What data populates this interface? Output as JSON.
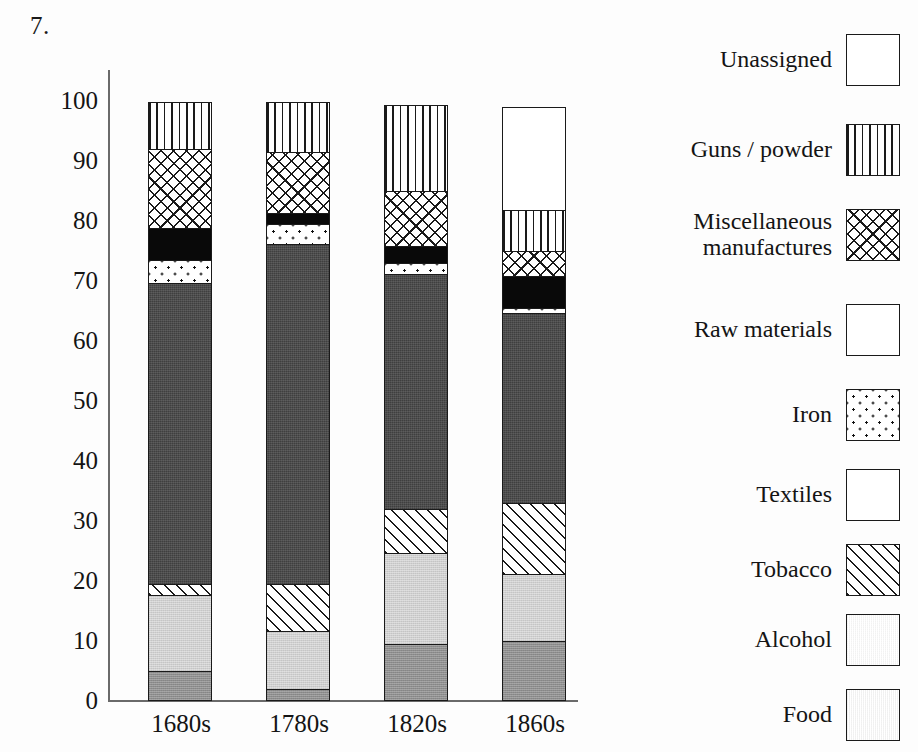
{
  "figure": {
    "number": "7."
  },
  "axes": {
    "y_ticks": [
      "100",
      "90",
      "80",
      "70",
      "60",
      "50",
      "40",
      "30",
      "20",
      "10",
      "0"
    ],
    "x_ticks": [
      "1680s",
      "1780s",
      "1820s",
      "1860s"
    ]
  },
  "legend": {
    "items": [
      {
        "label": "Unassigned",
        "pattern": "pat-unassigned",
        "name": "unassigned"
      },
      {
        "label": "Guns / powder",
        "pattern": "pat-guns",
        "name": "guns-powder"
      },
      {
        "label": "Miscellaneous\nmanufactures",
        "pattern": "pat-misc",
        "name": "miscellaneous-manufactures"
      },
      {
        "label": "Raw materials",
        "pattern": "pat-raw",
        "name": "raw-materials"
      },
      {
        "label": "Iron",
        "pattern": "pat-iron",
        "name": "iron"
      },
      {
        "label": "Textiles",
        "pattern": "pat-textiles",
        "name": "textiles"
      },
      {
        "label": "Tobacco",
        "pattern": "pat-tobacco",
        "name": "tobacco"
      },
      {
        "label": "Alcohol",
        "pattern": "pat-alcohol",
        "name": "alcohol"
      },
      {
        "label": "Food",
        "pattern": "pat-food",
        "name": "food"
      }
    ]
  },
  "chart_data": {
    "type": "bar",
    "subtype": "stacked-bar",
    "title": "",
    "xlabel": "",
    "ylabel": "",
    "ylim": [
      0,
      105
    ],
    "y_tick_values": [
      0,
      10,
      20,
      30,
      40,
      50,
      60,
      70,
      80,
      90,
      100
    ],
    "grid": false,
    "legend_position": "right",
    "categories": [
      "1680s",
      "1780s",
      "1820s",
      "1860s"
    ],
    "stack_order_bottom_to_top": [
      "Food",
      "Alcohol",
      "Tobacco",
      "Textiles",
      "Iron",
      "Raw materials",
      "Miscellaneous manufactures",
      "Guns / powder",
      "Unassigned"
    ],
    "series": [
      {
        "name": "Food",
        "pattern": "pat-food",
        "values": [
          5.0,
          2.0,
          9.5,
          10.0
        ]
      },
      {
        "name": "Alcohol",
        "pattern": "pat-alcohol",
        "values": [
          13.0,
          10.0,
          15.5,
          11.5
        ]
      },
      {
        "name": "Tobacco",
        "pattern": "pat-tobacco",
        "values": [
          2.0,
          8.0,
          7.5,
          12.0
        ]
      },
      {
        "name": "Textiles",
        "pattern": "pat-textiles",
        "values": [
          50.5,
          57.0,
          39.5,
          32.0
        ]
      },
      {
        "name": "Iron",
        "pattern": "pat-iron",
        "values": [
          4.0,
          3.5,
          2.0,
          1.0
        ]
      },
      {
        "name": "Raw materials",
        "pattern": "pat-raw",
        "values": [
          5.5,
          2.0,
          3.0,
          5.5
        ]
      },
      {
        "name": "Miscellaneous manufactures",
        "pattern": "pat-misc",
        "values": [
          13.5,
          10.5,
          9.5,
          4.5
        ]
      },
      {
        "name": "Guns / powder",
        "pattern": "pat-guns",
        "values": [
          8.0,
          8.5,
          14.5,
          7.0
        ]
      },
      {
        "name": "Unassigned",
        "pattern": "pat-unassigned",
        "values": [
          0.0,
          0.0,
          0.0,
          17.5
        ]
      }
    ],
    "cumulative_tops": {
      "1680s": [
        5.0,
        18.0,
        20.0,
        70.5,
        74.5,
        80.0,
        93.5,
        101.5,
        101.5
      ],
      "1780s": [
        2.0,
        12.0,
        20.0,
        77.0,
        80.5,
        82.5,
        93.0,
        101.5,
        101.5
      ],
      "1820s": [
        9.5,
        25.0,
        32.5,
        72.0,
        74.0,
        77.0,
        86.5,
        101.0,
        101.0
      ],
      "1860s": [
        10.0,
        21.5,
        33.5,
        65.5,
        66.5,
        72.0,
        76.5,
        83.5,
        101.0
      ]
    }
  },
  "colors": {
    "ink": "#1a1a1a",
    "axis": "#6a6a6a",
    "textiles": "#3f3f3f",
    "alcohol": "#cfcfcf",
    "food": "#8e8e8e",
    "raw_materials": "#090909",
    "background": "#fdfdfd"
  }
}
